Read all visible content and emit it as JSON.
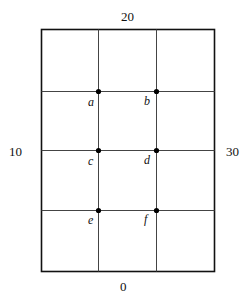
{
  "boundary_values": {
    "top": "20",
    "left": "10",
    "right": "30",
    "bottom": "0"
  },
  "points": [
    {
      "label": "a",
      "row": 1,
      "col": 1
    },
    {
      "label": "b",
      "row": 1,
      "col": 2
    },
    {
      "label": "c",
      "row": 2,
      "col": 1
    },
    {
      "label": "d",
      "row": 2,
      "col": 2
    },
    {
      "label": "e",
      "row": 3,
      "col": 1
    },
    {
      "label": "f",
      "row": 3,
      "col": 2
    }
  ],
  "grid": {
    "columns": 3,
    "rows": 4
  }
}
